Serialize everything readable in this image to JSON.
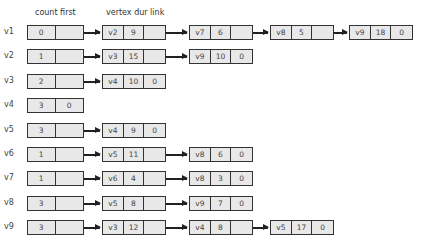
{
  "headers": {
    "head_fields": "count first",
    "node_fields": "vertex dur link"
  },
  "rows": [
    {
      "label": "v1",
      "count": "0",
      "first": "",
      "nodes": [
        {
          "vertex": "v2",
          "dur": "9",
          "link": ""
        },
        {
          "vertex": "v7",
          "dur": "6",
          "link": ""
        },
        {
          "vertex": "v8",
          "dur": "5",
          "link": ""
        },
        {
          "vertex": "v9",
          "dur": "18",
          "link": "0"
        }
      ]
    },
    {
      "label": "v2",
      "count": "1",
      "first": "",
      "nodes": [
        {
          "vertex": "v3",
          "dur": "15",
          "link": ""
        },
        {
          "vertex": "v9",
          "dur": "10",
          "link": "0"
        }
      ]
    },
    {
      "label": "v3",
      "count": "2",
      "first": "",
      "nodes": [
        {
          "vertex": "v4",
          "dur": "10",
          "link": "0"
        }
      ]
    },
    {
      "label": "v4",
      "count": "3",
      "first": "0",
      "nodes": []
    },
    {
      "label": "v5",
      "count": "3",
      "first": "",
      "nodes": [
        {
          "vertex": "v4",
          "dur": "9",
          "link": "0"
        }
      ]
    },
    {
      "label": "v6",
      "count": "1",
      "first": "",
      "nodes": [
        {
          "vertex": "v5",
          "dur": "11",
          "link": ""
        },
        {
          "vertex": "v8",
          "dur": "6",
          "link": "0"
        }
      ]
    },
    {
      "label": "v7",
      "count": "1",
      "first": "",
      "nodes": [
        {
          "vertex": "v6",
          "dur": "4",
          "link": ""
        },
        {
          "vertex": "v8",
          "dur": "3",
          "link": "0"
        }
      ]
    },
    {
      "label": "v8",
      "count": "3",
      "first": "",
      "nodes": [
        {
          "vertex": "v5",
          "dur": "8",
          "link": ""
        },
        {
          "vertex": "v9",
          "dur": "7",
          "link": "0"
        }
      ]
    },
    {
      "label": "v9",
      "count": "3",
      "first": "",
      "nodes": [
        {
          "vertex": "v3",
          "dur": "12",
          "link": ""
        },
        {
          "vertex": "v4",
          "dur": "8",
          "link": ""
        },
        {
          "vertex": "v5",
          "dur": "17",
          "link": "0"
        }
      ]
    }
  ]
}
